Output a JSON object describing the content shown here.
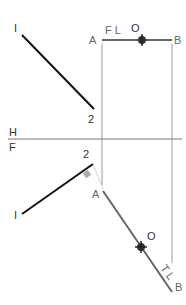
{
  "diagram": {
    "top_view": {
      "line_12": {
        "label_1": "I",
        "label_2": "2"
      },
      "true_length_line": {
        "label_a": "A",
        "label_b": "B",
        "label_fl": "F L",
        "label_o": "O"
      }
    },
    "fold_line": {
      "label_h": "H",
      "label_f": "F"
    },
    "front_view": {
      "line_12": {
        "label_1": "I",
        "label_2": "2"
      },
      "point_view_line": {
        "label_a": "A",
        "label_b": "B",
        "label_o": "O",
        "label_tl": "T L"
      }
    },
    "colors": {
      "line_dark": "#111111",
      "line_gray": "#777777",
      "projection": "#999999",
      "marker": "#333333",
      "right_angle": "#aaaaaa"
    }
  }
}
